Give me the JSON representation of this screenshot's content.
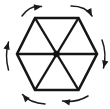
{
  "figure": {
    "width": 110,
    "height": 109,
    "background_color": "#ffffff",
    "stroke_color": "#161616",
    "arrow_color": "#1a1a1a"
  },
  "shape": {
    "name": "hexagon",
    "orientation": "flat-top",
    "vertex_count": 6,
    "center": {
      "x": 56.5,
      "y": 54
    },
    "vertices": [
      {
        "label": "top-left",
        "x": 35,
        "y": 18
      },
      {
        "label": "top-right",
        "x": 78.5,
        "y": 18
      },
      {
        "label": "right",
        "x": 97,
        "y": 54
      },
      {
        "label": "bottom-right",
        "x": 78.5,
        "y": 90
      },
      {
        "label": "bottom-left",
        "x": 35,
        "y": 90
      },
      {
        "label": "left",
        "x": 17,
        "y": 54
      }
    ],
    "diagonals": [
      {
        "label": "horizontal-diagonal",
        "from": "left",
        "to": "right"
      },
      {
        "label": "down-right-diagonal",
        "from": "top-left",
        "to": "bottom-right"
      },
      {
        "label": "down-left-diagonal",
        "from": "top-right",
        "to": "bottom-left"
      }
    ],
    "interior_region_count": 6,
    "center_dot_radius": 3.2
  },
  "rotation": {
    "direction": "clockwise",
    "arrow_count": 6,
    "arrows": [
      {
        "label": "arrow-top-left",
        "path": "M 22 16 Q 30 5 41.5 6.5",
        "head": "41.5,6.5",
        "head_angle": -8
      },
      {
        "label": "arrow-top-right",
        "path": "M 71 6 Q 86 6 92 16",
        "head": "92,16",
        "head_angle": 62
      },
      {
        "label": "arrow-right",
        "path": "M 102 40 Q 107 53 103.5 68",
        "head": "103.5,68",
        "head_angle": 104
      },
      {
        "label": "arrow-bottom-right",
        "path": "M 88 96 Q 76 103 62.5 101",
        "head": "62.5,101",
        "head_angle": 190
      },
      {
        "label": "arrow-bottom-left",
        "path": "M 45 104 Q 30 103 22.5 94.5",
        "head": "22.5,94.5",
        "head_angle": 228
      },
      {
        "label": "arrow-left",
        "path": "M 8.5 70 Q 4.5 55 8.5 42",
        "head": "8.5,42",
        "head_angle": -75
      }
    ]
  }
}
